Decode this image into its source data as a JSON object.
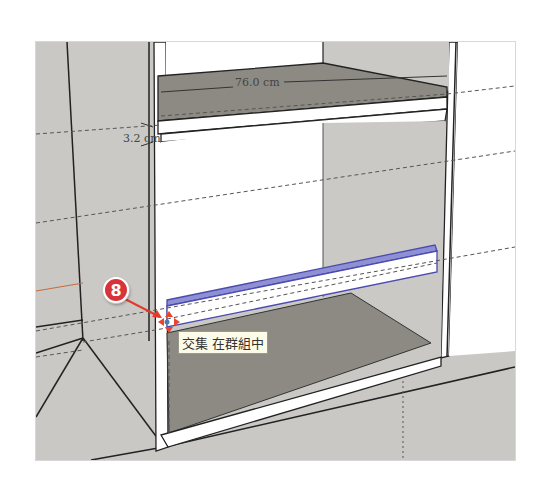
{
  "scene": {
    "app": "SketchUp",
    "description": "Cabinet model with shelf being placed"
  },
  "dimensions": {
    "width_label": "76.0 cm",
    "thickness_label": "3.2 cm"
  },
  "annotation": {
    "step_number": "8",
    "badge_color": "#d8333a"
  },
  "inference_tooltip": {
    "text": "交集 在群組中"
  },
  "colors": {
    "background_wall": "#c9c8c5",
    "shelf_top": "#8d8a84",
    "panel_white": "#ffffff",
    "selection_blue": "#4a4ab0",
    "inference_marker": "#e8452c"
  }
}
